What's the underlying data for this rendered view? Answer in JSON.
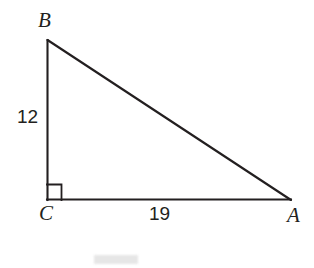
{
  "figure": {
    "kind": "right-triangle-diagram",
    "background_color": "#ffffff",
    "stroke_color": "#231f20",
    "stroke_width": 2,
    "vertices": {
      "B": {
        "label": "B",
        "x": 47,
        "y": 40
      },
      "C": {
        "label": "C",
        "x": 47,
        "y": 200
      },
      "A": {
        "label": "A",
        "x": 291,
        "y": 200
      }
    },
    "right_angle": {
      "at_vertex": "C",
      "marker": "square",
      "size": 15
    },
    "sides": {
      "BC": {
        "label": "12",
        "value": 12,
        "orientation": "vertical"
      },
      "CA": {
        "label": "19",
        "value": 19,
        "orientation": "horizontal"
      },
      "AB": {
        "label": "",
        "value": null,
        "orientation": "hypotenuse"
      }
    },
    "watermark": {
      "present": true,
      "text": "",
      "color": "#e2e2e2"
    }
  }
}
